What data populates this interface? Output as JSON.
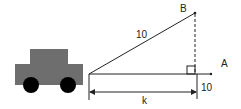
{
  "diagram": {
    "labels": {
      "point_b": "B",
      "point_a": "A",
      "hypotenuse": "10",
      "base": "k",
      "vertical_offset": "10"
    },
    "colors": {
      "car_body": "#6e6e6e",
      "wheel": "#000000",
      "line": "#222222"
    },
    "icons": [
      "car-icon",
      "right-angle-marker"
    ]
  }
}
